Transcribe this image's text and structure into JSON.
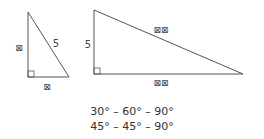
{
  "diagram": {
    "small_triangle": {
      "vertices": {
        "top": [
          28,
          12
        ],
        "right_angle": [
          28,
          77
        ],
        "right": [
          69,
          77
        ]
      },
      "labels": {
        "vertical_leg": "⊠",
        "hypotenuse": "5",
        "horizontal_leg": "⊠"
      }
    },
    "large_triangle": {
      "vertices": {
        "top": [
          94,
          10
        ],
        "right_angle": [
          94,
          74
        ],
        "right": [
          243,
          74
        ]
      },
      "labels": {
        "vertical_leg": "5",
        "hypotenuse": "⊠⊠",
        "horizontal_leg": "⊠⊠"
      }
    },
    "stroke_color": "#555555",
    "ratios": [
      "30° – 60° – 90°",
      "45° – 45° – 90°"
    ]
  }
}
